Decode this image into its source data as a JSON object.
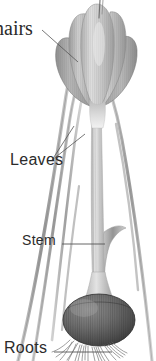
{
  "figure": {
    "background_color": "#ffffff",
    "line_color": "#555555",
    "text_color": "#2b2b2b"
  },
  "labels": {
    "hairs": "hairs",
    "leaves": "Leaves",
    "stem": "Stem",
    "roots": "Roots"
  },
  "parts": {
    "flower": "flower-head",
    "leaf_blades": "leaf-blades",
    "stem": "stem",
    "bulb": "bulb",
    "roots": "root-hairs"
  }
}
